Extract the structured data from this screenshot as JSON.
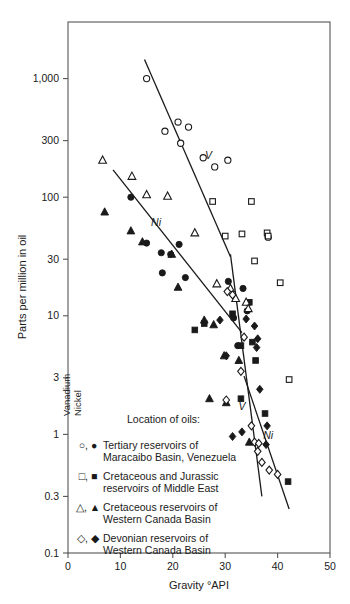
{
  "chart_data": {
    "type": "scatter",
    "title": "",
    "xlabel": "Gravity °API",
    "ylabel": "Parts per million in oil",
    "xlim": [
      0,
      50
    ],
    "ylim": [
      0.1,
      3000
    ],
    "yscale": "log",
    "xscale": "linear",
    "grid": false,
    "xticks": [
      0,
      10,
      20,
      30,
      40,
      50
    ],
    "xtick_labels": [
      "0",
      "10",
      "20",
      "30",
      "40",
      "50"
    ],
    "yticks": [
      0.1,
      0.3,
      1,
      3,
      10,
      30,
      100,
      300,
      1000
    ],
    "ytick_labels": [
      "0.1",
      "0.3",
      "1",
      "3",
      "10",
      "30",
      "100",
      "300",
      "1,000"
    ],
    "legend_position": "inside-lower-left",
    "legend_title": "Location of oils:",
    "legend_column_headers": [
      "Vanadium",
      "Nickel"
    ],
    "annotations": [
      {
        "text": "V",
        "x": 26.8,
        "y": 210,
        "note": "vanadium upper trend line label"
      },
      {
        "text": "Ni",
        "x": 16.8,
        "y": 57,
        "note": "nickel upper trend line label"
      },
      {
        "text": "V",
        "x": 33.2,
        "y": 1.62,
        "note": "vanadium lower trend line label"
      },
      {
        "text": "Ni",
        "x": 38.2,
        "y": 0.92,
        "note": "nickel lower trend line label"
      }
    ],
    "trend_lines": [
      {
        "name": "vanadium-upper",
        "element": "V",
        "points": [
          [
            14.6,
            1450
          ],
          [
            31.0,
            31.5
          ]
        ]
      },
      {
        "name": "nickel-upper",
        "element": "Ni",
        "points": [
          [
            8.6,
            170
          ],
          [
            33.2,
            7.2
          ]
        ]
      },
      {
        "name": "vanadium-lower",
        "element": "V",
        "points": [
          [
            31.0,
            33.0
          ],
          [
            37.0,
            0.3
          ]
        ]
      },
      {
        "name": "nickel-lower",
        "element": "Ni",
        "points": [
          [
            33.6,
            3.1
          ],
          [
            42.2,
            0.235
          ]
        ]
      }
    ],
    "series": [
      {
        "name": "Vanadium — Tertiary reservoirs of Maracaibo Basin, Venezuela",
        "element": "Vanadium",
        "marker": "open-circle",
        "points": [
          [
            15.0,
            1000
          ],
          [
            18.5,
            360
          ],
          [
            21.0,
            430
          ],
          [
            23.0,
            390
          ],
          [
            21.5,
            285
          ],
          [
            25.8,
            215
          ],
          [
            30.5,
            205
          ],
          [
            28.0,
            180
          ],
          [
            38.2,
            46
          ]
        ]
      },
      {
        "name": "Nickel — Tertiary reservoirs of Maracaibo Basin, Venezuela",
        "element": "Nickel",
        "marker": "filled-circle",
        "points": [
          [
            12.0,
            100
          ],
          [
            15.0,
            41
          ],
          [
            17.8,
            34
          ],
          [
            19.6,
            33
          ],
          [
            21.2,
            40
          ],
          [
            18.0,
            23
          ],
          [
            22.4,
            21
          ],
          [
            30.6,
            19.5
          ],
          [
            33.4,
            17.0
          ],
          [
            31.6,
            9.6
          ],
          [
            32.4,
            5.6
          ],
          [
            34.2,
            11.0
          ]
        ]
      },
      {
        "name": "Vanadium — Cretaceous and Jurassic reservoirs of Middle East",
        "element": "Vanadium",
        "marker": "open-square",
        "points": [
          [
            27.6,
            92
          ],
          [
            30.0,
            47
          ],
          [
            33.2,
            49
          ],
          [
            35.0,
            92
          ],
          [
            38.0,
            50
          ],
          [
            38.2,
            47
          ],
          [
            35.6,
            29
          ],
          [
            40.5,
            19
          ],
          [
            42.2,
            2.9
          ]
        ]
      },
      {
        "name": "Nickel — Cretaceous and Jurassic reservoirs of Middle East",
        "element": "Nickel",
        "marker": "filled-square",
        "points": [
          [
            24.2,
            7.6
          ],
          [
            26.0,
            8.6
          ],
          [
            31.4,
            10.4
          ],
          [
            33.0,
            5.6
          ],
          [
            34.6,
            13.0
          ],
          [
            35.2,
            6.0
          ],
          [
            35.8,
            4.2
          ],
          [
            33.0,
            2.0
          ],
          [
            37.6,
            1.5
          ],
          [
            42.0,
            0.4
          ]
        ]
      },
      {
        "name": "Vanadium — Cretaceous reservoirs of Western Canada Basin",
        "element": "Vanadium",
        "marker": "open-triangle",
        "points": [
          [
            6.6,
            205
          ],
          [
            12.2,
            150
          ],
          [
            15.0,
            105
          ],
          [
            19.0,
            102
          ],
          [
            24.2,
            50
          ],
          [
            28.4,
            18.6
          ],
          [
            31.0,
            17.0
          ],
          [
            32.0,
            14.0
          ],
          [
            34.0,
            13.0
          ],
          [
            34.4,
            11.5
          ]
        ]
      },
      {
        "name": "Nickel — Cretaceous reservoirs of Western Canada Basin",
        "element": "Nickel",
        "marker": "filled-triangle",
        "points": [
          [
            7.0,
            75
          ],
          [
            12.0,
            52
          ],
          [
            14.2,
            42
          ],
          [
            19.8,
            33
          ],
          [
            21.0,
            17.4
          ],
          [
            26.0,
            9.2
          ],
          [
            27.8,
            8.4
          ],
          [
            29.8,
            4.6
          ],
          [
            32.6,
            4.2
          ],
          [
            27.0,
            2.0
          ],
          [
            30.2,
            1.85
          ],
          [
            34.6,
            0.86
          ]
        ]
      },
      {
        "name": "Vanadium — Devonian reservoirs of Western Canada Basin",
        "element": "Vanadium",
        "marker": "open-diamond",
        "points": [
          [
            30.4,
            16.0
          ],
          [
            31.4,
            15.0
          ],
          [
            33.0,
            3.4
          ],
          [
            30.2,
            1.95
          ],
          [
            35.0,
            1.18
          ],
          [
            35.6,
            0.86
          ],
          [
            36.4,
            0.84
          ],
          [
            36.2,
            0.72
          ],
          [
            37.0,
            0.58
          ],
          [
            38.4,
            0.5
          ],
          [
            40.0,
            0.46
          ],
          [
            33.6,
            6.6
          ]
        ]
      },
      {
        "name": "Nickel — Devonian reservoirs of Western Canada Basin",
        "element": "Nickel",
        "marker": "filled-diamond",
        "points": [
          [
            29.0,
            9.2
          ],
          [
            30.2,
            4.6
          ],
          [
            34.0,
            9.4
          ],
          [
            35.6,
            8.2
          ],
          [
            36.2,
            6.4
          ],
          [
            36.0,
            5.4
          ],
          [
            36.6,
            2.4
          ],
          [
            38.0,
            1.18
          ],
          [
            37.8,
            0.82
          ],
          [
            31.4,
            0.96
          ],
          [
            33.2,
            1.05
          ]
        ]
      }
    ]
  },
  "axes": {
    "y_title": "Parts per million in oil",
    "x_title": "Gravity °API"
  },
  "legend": {
    "title": "Location of oils:",
    "rotated_headers": {
      "vanadium": "Vanadium",
      "nickel": "Nickel"
    },
    "entries": [
      {
        "markers": "○, ●",
        "line1": "Tertiary reservoirs of",
        "line2": "Maracaibo Basin, Venezuela"
      },
      {
        "markers": "□, ■",
        "line1": "Cretaceous and Jurassic",
        "line2": "reservoirs of Middle East"
      },
      {
        "markers": "△, ▲",
        "line1": "Cretaceous reservoirs of",
        "line2": "Western Canada Basin"
      },
      {
        "markers": "◇, ◆",
        "line1": "Devonian reservoirs of",
        "line2": "Western Canada Basin"
      }
    ]
  },
  "colors": {
    "ink": "#1a1a1a",
    "frame": "#555555",
    "background": "#ffffff"
  }
}
